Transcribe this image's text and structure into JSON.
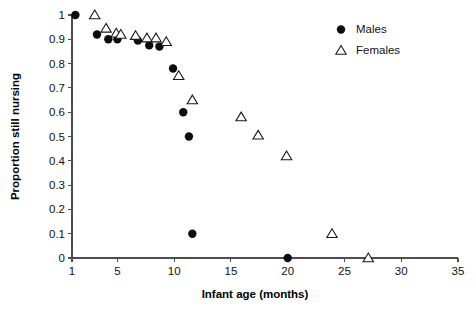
{
  "chart_data": {
    "type": "scatter",
    "title": "",
    "xlabel": "Infant age (months)",
    "ylabel": "Proportion still nursing",
    "xlim": [
      1,
      35
    ],
    "ylim": [
      0,
      1
    ],
    "grid": false,
    "legend_position": "top-right",
    "xticks": [
      1,
      5,
      10,
      15,
      20,
      25,
      30,
      35
    ],
    "xtick_labels": [
      "1",
      "5",
      "10",
      "15",
      "20",
      "25",
      "30",
      "35"
    ],
    "yticks": [
      0,
      0.1,
      0.2,
      0.3,
      0.4,
      0.5,
      0.6,
      0.7,
      0.8,
      0.9,
      1
    ],
    "ytick_labels": [
      "0",
      "0.1",
      "0.2",
      "0.3",
      "0.4",
      "0.5",
      "0.6",
      "0.7",
      "0.8",
      "0.9",
      "1"
    ],
    "series": [
      {
        "name": "Males",
        "marker": "filled-circle",
        "color": "#0d0d0d",
        "points": [
          {
            "x": 1.3,
            "y": 1.0
          },
          {
            "x": 3.2,
            "y": 0.92
          },
          {
            "x": 4.2,
            "y": 0.9
          },
          {
            "x": 5.0,
            "y": 0.9
          },
          {
            "x": 6.8,
            "y": 0.895
          },
          {
            "x": 7.8,
            "y": 0.875
          },
          {
            "x": 8.7,
            "y": 0.87
          },
          {
            "x": 9.9,
            "y": 0.78
          },
          {
            "x": 10.8,
            "y": 0.6
          },
          {
            "x": 11.3,
            "y": 0.5
          },
          {
            "x": 11.6,
            "y": 0.1
          },
          {
            "x": 20.0,
            "y": 0.0
          }
        ]
      },
      {
        "name": "Females",
        "marker": "open-triangle",
        "color": "#ffffff",
        "points": [
          {
            "x": 3.0,
            "y": 1.0
          },
          {
            "x": 4.0,
            "y": 0.945
          },
          {
            "x": 4.9,
            "y": 0.925
          },
          {
            "x": 5.3,
            "y": 0.92
          },
          {
            "x": 6.6,
            "y": 0.915
          },
          {
            "x": 7.6,
            "y": 0.905
          },
          {
            "x": 8.4,
            "y": 0.905
          },
          {
            "x": 9.3,
            "y": 0.89
          },
          {
            "x": 10.4,
            "y": 0.75
          },
          {
            "x": 11.6,
            "y": 0.65
          },
          {
            "x": 15.9,
            "y": 0.58
          },
          {
            "x": 17.4,
            "y": 0.505
          },
          {
            "x": 19.9,
            "y": 0.42
          },
          {
            "x": 23.9,
            "y": 0.1
          },
          {
            "x": 27.1,
            "y": 0.0
          }
        ]
      }
    ]
  },
  "legend": {
    "entries": [
      {
        "label": "Males",
        "marker": "filled-circle"
      },
      {
        "label": "Females",
        "marker": "open-triangle"
      }
    ]
  }
}
